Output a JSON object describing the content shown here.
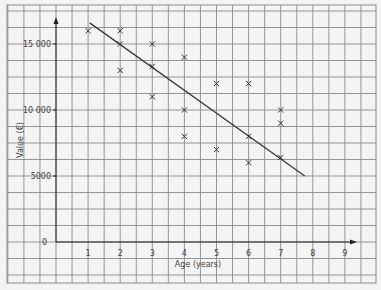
{
  "chart_data": {
    "type": "scatter",
    "title": "",
    "xlabel": "Age (years)",
    "ylabel": "Value (€)",
    "xlim": [
      0,
      9
    ],
    "ylim": [
      0,
      17000
    ],
    "x_ticks": [
      "1",
      "2",
      "3",
      "4",
      "5",
      "6",
      "7",
      "8",
      "9"
    ],
    "y_ticks": [
      "0",
      "5000",
      "10 000",
      "15 000"
    ],
    "grid": true,
    "legend": null,
    "series": [
      {
        "name": "Cars",
        "marker": "x",
        "points": [
          {
            "x": 1,
            "y": 16000
          },
          {
            "x": 2,
            "y": 16000
          },
          {
            "x": 2,
            "y": 15000
          },
          {
            "x": 2,
            "y": 13000
          },
          {
            "x": 3,
            "y": 15000
          },
          {
            "x": 3,
            "y": 13300
          },
          {
            "x": 3,
            "y": 11000
          },
          {
            "x": 4,
            "y": 14000
          },
          {
            "x": 4,
            "y": 10000
          },
          {
            "x": 4,
            "y": 8000
          },
          {
            "x": 5,
            "y": 12000
          },
          {
            "x": 5,
            "y": 7000
          },
          {
            "x": 6,
            "y": 12000
          },
          {
            "x": 6,
            "y": 8000
          },
          {
            "x": 6,
            "y": 6000
          },
          {
            "x": 7,
            "y": 10000
          },
          {
            "x": 7,
            "y": 9000
          },
          {
            "x": 7,
            "y": 6400
          }
        ]
      }
    ],
    "line_of_best_fit": {
      "x1": 1.05,
      "y1": 16600,
      "x2": 7.75,
      "y2": 5000
    }
  },
  "colors": {
    "background": "#f4f4f4",
    "grid": "#8a8a8a",
    "axis": "#222222",
    "marker": "#333333",
    "line": "#3a3a3a"
  }
}
